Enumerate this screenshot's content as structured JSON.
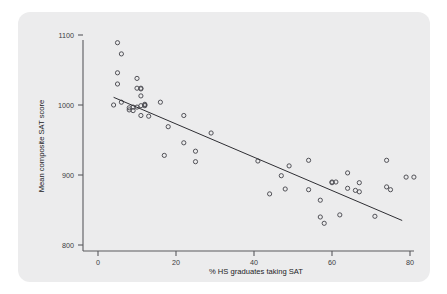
{
  "figure": {
    "background_color": "#ececed",
    "page_color": "#ffffff"
  },
  "chart_data": {
    "type": "scatter",
    "title": "",
    "subtitle": "",
    "xlabel": "% HS graduates taking SAT",
    "ylabel": "Mean composite SAT score",
    "xlim": [
      0,
      82
    ],
    "ylim": [
      790,
      1110
    ],
    "xticks": [
      0,
      20,
      40,
      60,
      80
    ],
    "xticklabels": [
      "0",
      "20",
      "40",
      "60",
      "80"
    ],
    "yticks": [
      800,
      900,
      1000,
      1100
    ],
    "yticklabels": [
      "800",
      "900",
      "1000",
      "1100"
    ],
    "grid": false,
    "legend": null,
    "marker_style": "open-circle",
    "marker_color": "#4a4a50",
    "line_color": "#2e2e33",
    "points": [
      [
        4,
        1000
      ],
      [
        5,
        1089
      ],
      [
        5,
        1046
      ],
      [
        5,
        1030
      ],
      [
        6,
        1073
      ],
      [
        6,
        1004
      ],
      [
        8,
        993
      ],
      [
        8,
        996
      ],
      [
        9,
        997
      ],
      [
        9,
        992
      ],
      [
        10,
        1024
      ],
      [
        10,
        1038
      ],
      [
        10,
        997
      ],
      [
        11,
        1024
      ],
      [
        11,
        1023
      ],
      [
        11,
        1013
      ],
      [
        11,
        999
      ],
      [
        11,
        985
      ],
      [
        12,
        1001
      ],
      [
        12,
        999
      ],
      [
        12,
        1000
      ],
      [
        13,
        984
      ],
      [
        16,
        1004
      ],
      [
        17,
        928
      ],
      [
        18,
        969
      ],
      [
        22,
        946
      ],
      [
        22,
        985
      ],
      [
        25,
        934
      ],
      [
        25,
        919
      ],
      [
        29,
        960
      ],
      [
        41,
        920
      ],
      [
        44,
        873
      ],
      [
        47,
        899
      ],
      [
        48,
        880
      ],
      [
        49,
        913
      ],
      [
        54,
        921
      ],
      [
        54,
        879
      ],
      [
        57,
        864
      ],
      [
        57,
        840
      ],
      [
        58,
        831
      ],
      [
        60,
        890
      ],
      [
        60,
        889
      ],
      [
        61,
        890
      ],
      [
        62,
        843
      ],
      [
        64,
        903
      ],
      [
        64,
        881
      ],
      [
        66,
        878
      ],
      [
        67,
        889
      ],
      [
        67,
        876
      ],
      [
        71,
        841
      ],
      [
        74,
        883
      ],
      [
        74,
        921
      ],
      [
        75,
        879
      ],
      [
        79,
        897
      ],
      [
        81,
        897
      ]
    ],
    "fit_line": {
      "type": "linear-regression",
      "x_start": 4,
      "y_start": 1011,
      "x_end": 78,
      "y_end": 835
    }
  }
}
